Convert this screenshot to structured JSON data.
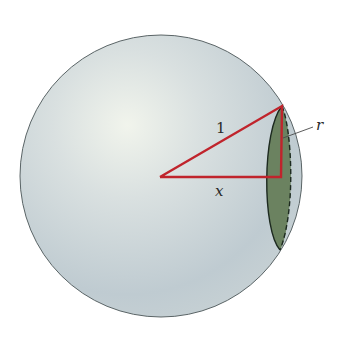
{
  "diagram": {
    "labels": {
      "hypotenuse": "1",
      "horizontal_leg": "x",
      "cap_radius": "r"
    },
    "colors": {
      "sphere_fill": "#c9d3d6",
      "sphere_highlight": "#eef2ea",
      "sphere_outline": "#5a6466",
      "triangle": "#c0242c",
      "cap_fill": "#6b8260",
      "cap_outline": "#1d2a20"
    }
  }
}
